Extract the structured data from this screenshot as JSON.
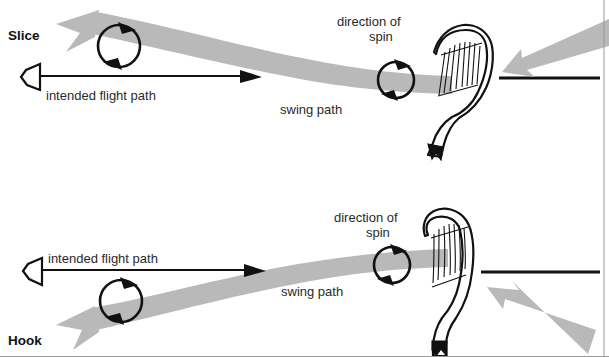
{
  "figure": {
    "width": 609,
    "height": 357,
    "background": "#ffffff",
    "band_color": "#b9b9b9",
    "ink_color": "#111111"
  },
  "panels": [
    {
      "id": "slice",
      "name_label": "Slice",
      "labels": {
        "intended_flight_path": "intended flight path",
        "swing_path": "swing path",
        "direction_of_spin_line1": "direction of",
        "direction_of_spin_line2": "spin"
      }
    },
    {
      "id": "hook",
      "name_label": "Hook",
      "labels": {
        "intended_flight_path": "intended flight path",
        "swing_path": "swing path",
        "direction_of_spin_line1": "direction of",
        "direction_of_spin_line2": "spin"
      }
    }
  ]
}
